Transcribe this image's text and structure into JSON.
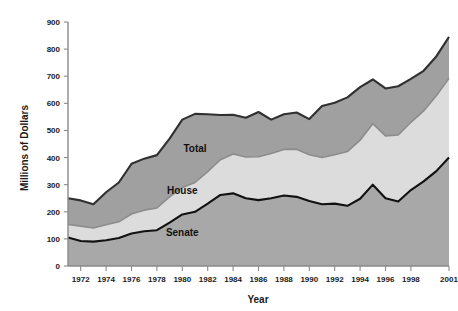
{
  "chart_data": {
    "type": "area",
    "stacked": true,
    "title": "",
    "xlabel": "Year",
    "ylabel": "Millions of Dollars",
    "ylim": [
      0,
      900
    ],
    "xlim": [
      1971,
      2001
    ],
    "ytick_step": 100,
    "yticks": [
      0,
      100,
      200,
      300,
      400,
      500,
      600,
      700,
      800,
      900
    ],
    "xticks": [
      1972,
      1974,
      1976,
      1978,
      1980,
      1982,
      1984,
      1986,
      1988,
      1990,
      1992,
      1994,
      1996,
      1998,
      2001
    ],
    "grid": false,
    "legend_position": "inline-annotations",
    "x": [
      1971,
      1972,
      1973,
      1974,
      1975,
      1976,
      1977,
      1978,
      1979,
      1980,
      1981,
      1982,
      1983,
      1984,
      1985,
      1986,
      1987,
      1988,
      1989,
      1990,
      1991,
      1992,
      1993,
      1994,
      1995,
      1996,
      1997,
      1998,
      1999,
      2000,
      2001
    ],
    "series": [
      {
        "name": "Senate",
        "color": "#a8a8a8",
        "line_color": "#111111",
        "values": [
          105,
          92,
          90,
          95,
          103,
          120,
          128,
          132,
          160,
          190,
          200,
          230,
          262,
          268,
          250,
          243,
          250,
          260,
          255,
          240,
          228,
          230,
          222,
          248,
          300,
          250,
          238,
          280,
          312,
          350,
          400
        ]
      },
      {
        "name": "House",
        "color": "#dcdcdc",
        "line_color": "#8c8c8c",
        "values": [
          48,
          55,
          50,
          57,
          60,
          72,
          78,
          82,
          95,
          100,
          108,
          118,
          130,
          145,
          152,
          160,
          165,
          170,
          176,
          170,
          172,
          180,
          200,
          216,
          225,
          230,
          245,
          250,
          260,
          278,
          292
        ]
      },
      {
        "name": "Total",
        "color": "#a0a0a0",
        "line_color": "#303030",
        "values": [
          97,
          95,
          88,
          120,
          145,
          185,
          190,
          195,
          215,
          250,
          253,
          212,
          165,
          145,
          145,
          165,
          125,
          130,
          135,
          132,
          190,
          192,
          200,
          196,
          163,
          175,
          180,
          160,
          148,
          145,
          153
        ]
      }
    ],
    "cumulative_top": [
      250,
      242,
      228,
      272,
      308,
      377,
      396,
      409,
      470,
      540,
      561,
      560,
      557,
      558,
      547,
      568,
      540,
      560,
      566,
      542,
      590,
      602,
      622,
      660,
      688,
      655,
      663,
      690,
      720,
      773,
      845
    ],
    "annotations": [
      {
        "text": "Total",
        "x": 1981,
        "y": 420
      },
      {
        "text": "House",
        "x": 1980,
        "y": 265
      },
      {
        "text": "Senate",
        "x": 1980,
        "y": 110
      }
    ]
  },
  "axis": {
    "ylabel": "Millions of Dollars",
    "xlabel": "Year",
    "ytick_labels": [
      "0",
      "100",
      "200",
      "300",
      "400",
      "500",
      "600",
      "700",
      "800",
      "900"
    ],
    "xtick_labels": [
      "1972",
      "1974",
      "1976",
      "1978",
      "1980",
      "1982",
      "1984",
      "1986",
      "1988",
      "1990",
      "1992",
      "1994",
      "1996",
      "1998",
      "2001"
    ]
  },
  "colors": {
    "background": "#ffffff",
    "senate_fill": "#a8a8a8",
    "house_fill": "#dcdcdc",
    "total_fill": "#a0a0a0",
    "senate_line": "#111111",
    "house_line": "#8c8c8c",
    "total_line": "#303030",
    "axis": "#8a8a8a",
    "text": "#1a1a1a"
  }
}
